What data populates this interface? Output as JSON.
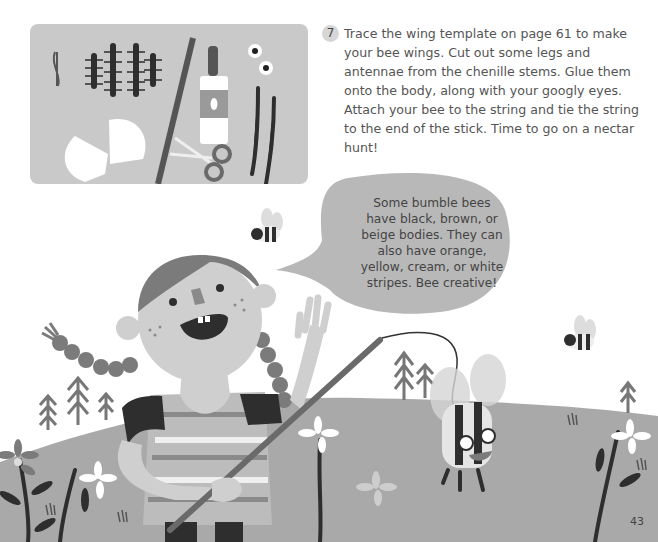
{
  "page": {
    "number": "43"
  },
  "instruction": {
    "step": "7",
    "text": "Trace the wing template on page 61 to make your bee wings. Cut out some legs and antennae from the chenille stems. Glue them onto the body, along with your googly eyes. Attach your bee to the string and tie the string to the end of the stick. Time to go on a nectar hunt!"
  },
  "speech_bubble": {
    "text": "Some bumble bees have black, brown, or beige bodies. They can also have orange, yellow, cream, or white stripes. Bee creative!"
  },
  "supplies": {
    "items": [
      "string",
      "chenille-stems",
      "stick",
      "glue-bottle",
      "googly-eyes",
      "paper-wings",
      "scissors",
      "black-chenille-stems"
    ]
  },
  "colors": {
    "background": "#ffffff",
    "card": "#c9c9c9",
    "hill": "#a9a9a9",
    "bubble": "#b8b8b8",
    "text": "#555555",
    "dark": "#2e2e2e",
    "mid": "#7b7b7b",
    "skin": "#cfcfcf"
  }
}
